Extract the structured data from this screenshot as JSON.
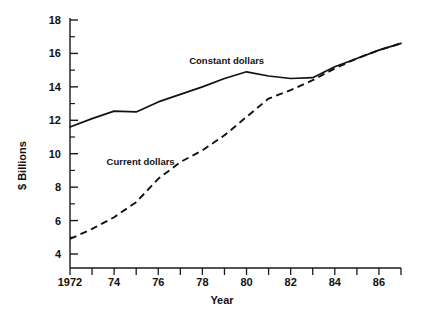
{
  "chart_data": {
    "type": "line",
    "title": "",
    "xlabel": "Year",
    "ylabel": "$ Billions",
    "xlim": [
      1972,
      1987
    ],
    "ylim": [
      3.2,
      18
    ],
    "grid": false,
    "legend_position": "inline-annotation",
    "x": [
      1972,
      1973,
      1974,
      1975,
      1976,
      1977,
      1978,
      1979,
      1980,
      1981,
      1982,
      1983,
      1984,
      1985,
      1986,
      1987
    ],
    "y_tick_values": [
      4,
      6,
      8,
      10,
      12,
      14,
      16,
      18
    ],
    "y_tick_labels": [
      "4",
      "6",
      "8",
      "10",
      "12",
      "14",
      "16",
      "18"
    ],
    "y_minor_tick_values": [
      5,
      7,
      9,
      11,
      13,
      15,
      17
    ],
    "x_tick_values": [
      1972,
      1973,
      1974,
      1975,
      1976,
      1977,
      1978,
      1979,
      1980,
      1981,
      1982,
      1983,
      1984,
      1985,
      1986,
      1987
    ],
    "x_tick_labels": [
      {
        "value": 1972,
        "label": "1972"
      },
      {
        "value": 1974,
        "label": "74"
      },
      {
        "value": 1976,
        "label": "76"
      },
      {
        "value": 1978,
        "label": "78"
      },
      {
        "value": 1980,
        "label": "80"
      },
      {
        "value": 1982,
        "label": "82"
      },
      {
        "value": 1984,
        "label": "84"
      },
      {
        "value": 1986,
        "label": "86"
      }
    ],
    "series": [
      {
        "name": "Constant dollars",
        "style": "solid",
        "color": "#000000",
        "label_x": 1979.1,
        "label_y": 15.35,
        "values": [
          11.6,
          12.1,
          12.55,
          12.5,
          13.1,
          13.55,
          14.0,
          14.5,
          14.9,
          14.65,
          14.5,
          14.55,
          15.2,
          15.7,
          16.2,
          16.6
        ]
      },
      {
        "name": "Current dollars",
        "style": "dashed",
        "color": "#000000",
        "label_x": 1975.2,
        "label_y": 9.3,
        "values": [
          4.9,
          5.5,
          6.2,
          7.1,
          8.5,
          9.5,
          10.2,
          11.1,
          12.2,
          13.3,
          13.8,
          14.4,
          15.1,
          15.7,
          16.2,
          16.6
        ]
      }
    ]
  },
  "axes": {
    "y_axis_title": "$ Billions",
    "x_axis_title": "Year"
  },
  "annotations": {
    "constant_dollars": "Constant dollars",
    "current_dollars": "Current dollars"
  },
  "caption": {
    "partial_footer_text": ""
  }
}
